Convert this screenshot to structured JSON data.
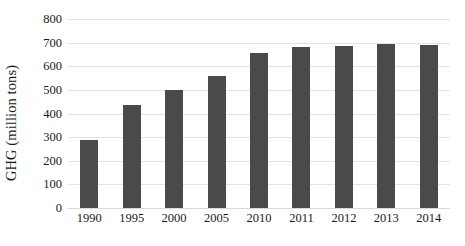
{
  "chart_data": {
    "type": "bar",
    "title": "",
    "xlabel": "",
    "ylabel": "GHG (million tons)",
    "categories": [
      "1990",
      "1995",
      "2000",
      "2005",
      "2010",
      "2011",
      "2012",
      "2013",
      "2014"
    ],
    "values": [
      290,
      435,
      498,
      557,
      655,
      682,
      686,
      695,
      690
    ],
    "series": [
      {
        "name": "GHG",
        "values": [
          290,
          435,
          498,
          557,
          655,
          682,
          686,
          695,
          690
        ]
      }
    ],
    "ylim": [
      0,
      800
    ],
    "ytick_labels": [
      "0",
      "100",
      "200",
      "300",
      "400",
      "500",
      "600",
      "700",
      "800"
    ],
    "ytick_values": [
      0,
      100,
      200,
      300,
      400,
      500,
      600,
      700,
      800
    ],
    "grid": true,
    "grid_axis": "y",
    "legend": false,
    "legend_position": "none",
    "bar_color": "#4a4a4a",
    "grid_color": "#e3e3e3",
    "background_color": "#ffffff",
    "text_color": "#1a1a1a"
  }
}
